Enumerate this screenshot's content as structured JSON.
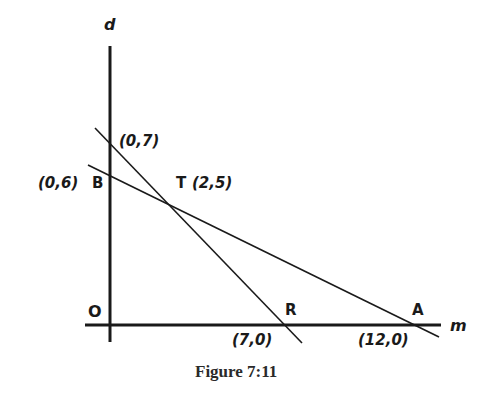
{
  "figure": {
    "caption": "Figure 7:11",
    "axes": {
      "vertical_label": "d",
      "horizontal_label": "m",
      "origin_label": "O"
    },
    "points": [
      {
        "name": "",
        "coords": "(0,7)"
      },
      {
        "name": "B",
        "coords": "(0,6)"
      },
      {
        "name": "T",
        "coords": "(2,5)"
      },
      {
        "name": "R",
        "coords": "(7,0)"
      },
      {
        "name": "A",
        "coords": "(12,0)"
      }
    ],
    "lines": [
      {
        "through": [
          "(0,7)",
          "(2,5)",
          "(7,0)"
        ]
      },
      {
        "through": [
          "(0,6)",
          "(2,5)",
          "(12,0)"
        ]
      }
    ],
    "colors": {
      "ink": "#1a1a1a",
      "background": "#ffffff"
    }
  }
}
